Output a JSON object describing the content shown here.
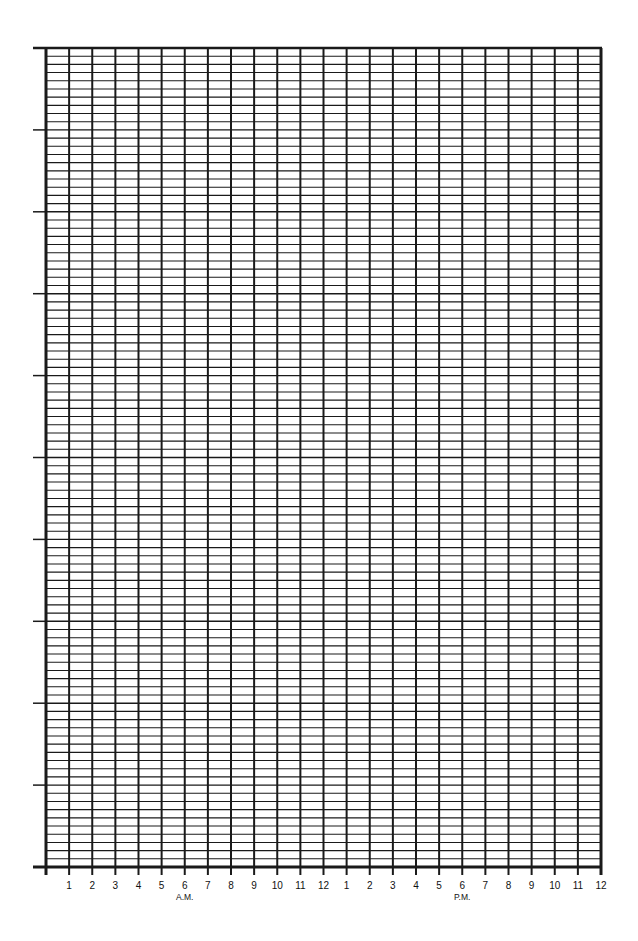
{
  "chart_data": {
    "type": "line",
    "title": "",
    "xlabel": "",
    "ylabel": "",
    "categories": [
      "1",
      "2",
      "3",
      "4",
      "5",
      "6",
      "7",
      "8",
      "9",
      "10",
      "11",
      "12",
      "1",
      "2",
      "3",
      "4",
      "5",
      "6",
      "7",
      "8",
      "9",
      "10",
      "11",
      "12"
    ],
    "x_period_labels": [
      {
        "label": "A.M.",
        "under_index": 5
      },
      {
        "label": "P.M.",
        "under_index": 17
      }
    ],
    "series": [],
    "y_major_divisions": 10,
    "y_minor_per_major": 10,
    "y_tick_labels": [],
    "grid": true,
    "legend": null
  },
  "layout": {
    "plot_left": 46,
    "plot_right": 601,
    "plot_top": 48,
    "plot_bottom": 867,
    "colors": {
      "line": "#1a1a1a",
      "background": "#ffffff"
    }
  }
}
